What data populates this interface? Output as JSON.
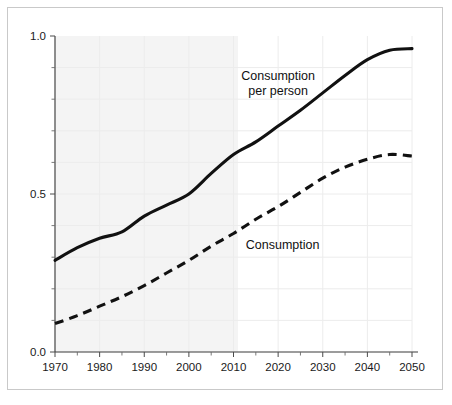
{
  "chart_data": {
    "type": "line",
    "title": "",
    "subtitle": "",
    "xlabel": "",
    "ylabel": "",
    "xlim": [
      1970,
      2050
    ],
    "ylim": [
      0.0,
      1.0
    ],
    "x_ticks": [
      1970,
      1980,
      1990,
      2000,
      2010,
      2020,
      2030,
      2040,
      2050
    ],
    "x_tick_labels": [
      "1970",
      "1980",
      "1990",
      "2000",
      "2010",
      "2020",
      "2030",
      "2040",
      "2050"
    ],
    "x_minor_ticks": [
      1975,
      1985,
      1995,
      2005,
      2015,
      2025,
      2035,
      2045
    ],
    "y_ticks": [
      0.0,
      0.5,
      1.0
    ],
    "y_tick_labels": [
      "0.0",
      "0.5",
      "1.0"
    ],
    "y_minor_ticks": [
      0.1,
      0.2,
      0.3,
      0.4,
      0.6,
      0.7,
      0.8,
      0.9
    ],
    "grid": true,
    "legend_position": "inline-annotations",
    "shaded_region": {
      "label": "historical",
      "x_start": 1970,
      "x_end": 2011,
      "color": "#f4f4f4"
    },
    "x": [
      1970,
      1975,
      1980,
      1985,
      1990,
      1995,
      2000,
      2005,
      2010,
      2015,
      2020,
      2025,
      2030,
      2035,
      2040,
      2045,
      2050
    ],
    "series": [
      {
        "name": "Consumption per person",
        "style": "solid",
        "color": "#111111",
        "annotation": "Consumption\nper person",
        "annotation_lines": [
          "Consumption",
          "per person"
        ],
        "annotation_x": 2020,
        "annotation_y": 0.86,
        "values": [
          0.29,
          0.33,
          0.36,
          0.38,
          0.43,
          0.465,
          0.5,
          0.565,
          0.625,
          0.665,
          0.715,
          0.765,
          0.82,
          0.875,
          0.925,
          0.955,
          0.96
        ]
      },
      {
        "name": "Consumption",
        "style": "dashed",
        "color": "#111111",
        "annotation": "Consumption",
        "annotation_lines": [
          "Consumption"
        ],
        "annotation_x": 2021,
        "annotation_y": 0.325,
        "values": [
          0.09,
          0.115,
          0.145,
          0.175,
          0.21,
          0.25,
          0.29,
          0.335,
          0.375,
          0.42,
          0.46,
          0.505,
          0.55,
          0.585,
          0.61,
          0.625,
          0.62
        ]
      }
    ]
  },
  "labels": {
    "series_1_line_1": "Consumption",
    "series_1_line_2": "per person",
    "series_2_line_1": "Consumption",
    "y_1_0": "1.0",
    "y_0_5": "0.5",
    "y_0_0": "0.0",
    "x_1970": "1970",
    "x_1980": "1980",
    "x_1990": "1990",
    "x_2000": "2000",
    "x_2010": "2010",
    "x_2020": "2020",
    "x_2030": "2030",
    "x_2040": "2040",
    "x_2050": "2050"
  },
  "colors": {
    "line": "#111111",
    "shade": "#f4f4f4",
    "grid": "#ececec",
    "frame_border": "#c9c9c9",
    "background": "#ffffff"
  }
}
